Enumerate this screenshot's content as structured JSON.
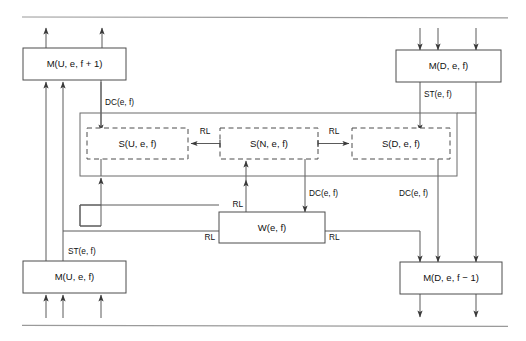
{
  "figure": {
    "type": "block-diagram",
    "title": "",
    "background_color": "#ffffff",
    "line_color": "#5a5a5a",
    "text_color": "#111111",
    "rule_color": "#9a9a9a"
  },
  "rules": [
    {
      "name": "top-rule",
      "y": 17
    },
    {
      "name": "bottom-rule",
      "y": 326
    }
  ],
  "boxes": [
    {
      "id": "mu_f1",
      "label": "M(U, e, f + 1)",
      "style": "solid",
      "x": 23,
      "y": 48,
      "w": 103,
      "h": 32
    },
    {
      "id": "md_f",
      "label": "M(D, e, f)",
      "style": "solid",
      "x": 396,
      "y": 50,
      "w": 105,
      "h": 32
    },
    {
      "id": "su",
      "label": "S(U, e, f)",
      "style": "dashed",
      "x": 87,
      "y": 128,
      "w": 101,
      "h": 31
    },
    {
      "id": "sn",
      "label": "S(N, e, f)",
      "style": "dashed",
      "x": 220,
      "y": 128,
      "w": 98,
      "h": 31
    },
    {
      "id": "sd",
      "label": "S(D, e, f)",
      "style": "dashed",
      "x": 352,
      "y": 128,
      "w": 98,
      "h": 31
    },
    {
      "id": "w",
      "label": "W(e, f)",
      "style": "solid",
      "x": 219,
      "y": 212,
      "w": 106,
      "h": 31
    },
    {
      "id": "mu_f",
      "label": "M(U, e, f)",
      "style": "solid",
      "x": 23,
      "y": 261,
      "w": 103,
      "h": 32
    },
    {
      "id": "md_f_1",
      "label": "M(D, e, f − 1)",
      "style": "solid",
      "x": 400,
      "y": 262,
      "w": 102,
      "h": 32
    }
  ],
  "containers": [
    {
      "id": "state-group",
      "style": "solid",
      "x": 80,
      "y": 113,
      "w": 377,
      "h": 63
    }
  ],
  "edge_labels": [
    {
      "id": "dc_top_left",
      "text": "DC(e, f)",
      "x": 105,
      "y": 105,
      "anchor": "start"
    },
    {
      "id": "rl_su_sn",
      "text": "RL",
      "x": 204,
      "y": 134,
      "anchor": "middle"
    },
    {
      "id": "rl_sn_sd",
      "text": "RL",
      "x": 335,
      "y": 134,
      "anchor": "middle"
    },
    {
      "id": "st_right_top",
      "text": "ST(e, f)",
      "x": 425,
      "y": 96,
      "anchor": "start"
    },
    {
      "id": "dc_center",
      "text": "DC(e, f)",
      "x": 310,
      "y": 196,
      "anchor": "start"
    },
    {
      "id": "dc_right",
      "text": "DC(e, f)",
      "x": 400,
      "y": 196,
      "anchor": "start"
    },
    {
      "id": "rl_w_top",
      "text": "RL",
      "x": 224,
      "y": 205,
      "anchor": "end"
    },
    {
      "id": "rl_w_left",
      "text": "RL",
      "x": 214,
      "y": 239,
      "anchor": "end"
    },
    {
      "id": "rl_w_right",
      "text": "RL",
      "x": 330,
      "y": 239,
      "anchor": "start"
    },
    {
      "id": "st_left_bot",
      "text": "ST(e, f)",
      "x": 69,
      "y": 254,
      "anchor": "start"
    }
  ],
  "arrows": {
    "top_out_mu": [
      {
        "x": 46,
        "from_y": 48,
        "to_y": 26
      },
      {
        "x": 102,
        "from_y": 48,
        "to_y": 26
      }
    ],
    "top_in_md": [
      {
        "x": 420,
        "from_y": 28,
        "to_y": 50
      },
      {
        "x": 438,
        "from_y": 28,
        "to_y": 50
      },
      {
        "x": 476,
        "from_y": 28,
        "to_y": 50
      }
    ],
    "bottom_in_mu": [
      {
        "x": 46,
        "from_y": 318,
        "to_y": 293
      },
      {
        "x": 63,
        "from_y": 318,
        "to_y": 293
      },
      {
        "x": 101,
        "from_y": 318,
        "to_y": 293
      }
    ],
    "bottom_out_md": [
      {
        "x": 420,
        "from_y": 294,
        "to_y": 317
      },
      {
        "x": 476,
        "from_y": 294,
        "to_y": 317
      }
    ]
  }
}
